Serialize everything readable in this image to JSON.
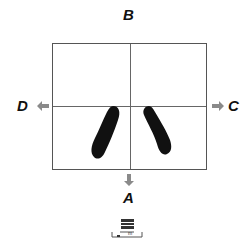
{
  "labels": {
    "top": "B",
    "bottom": "A",
    "left": "D",
    "right": "C"
  },
  "icons": {
    "arrow_left": "arrow-left-icon",
    "arrow_right": "arrow-right-icon",
    "arrow_down": "arrow-down-icon",
    "device": "device-icon"
  },
  "colors": {
    "arrow": "#8a8a8a",
    "shape": "#111111",
    "grid": "#666666"
  },
  "device_text": "m"
}
